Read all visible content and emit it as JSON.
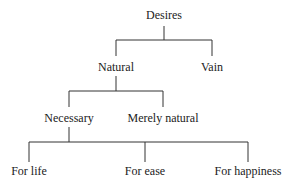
{
  "diagram": {
    "type": "tree",
    "root": {
      "label": "Desires",
      "children": [
        {
          "label": "Natural",
          "children": [
            {
              "label": "Necessary",
              "children": [
                {
                  "label": "For life"
                },
                {
                  "label": "For ease"
                },
                {
                  "label": "For happiness"
                }
              ]
            },
            {
              "label": "Merely natural"
            }
          ]
        },
        {
          "label": "Vain"
        }
      ]
    },
    "nodes": {
      "desires": "Desires",
      "natural": "Natural",
      "vain": "Vain",
      "necessary": "Necessary",
      "merely_natural": "Merely natural",
      "for_life": "For life",
      "for_ease": "For ease",
      "for_happiness": "For happiness"
    },
    "line_color": "#333333"
  }
}
